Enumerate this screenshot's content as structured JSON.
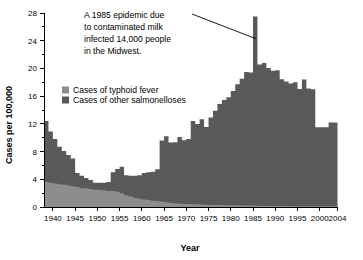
{
  "chart_data": {
    "type": "area",
    "title": "",
    "xlabel": "Year",
    "ylabel": "Cases per 100,000",
    "xlim": [
      1938,
      2004
    ],
    "ylim": [
      0,
      28
    ],
    "grid": false,
    "legend_position": "inside-upper-left",
    "y_ticks": [
      0,
      4,
      8,
      12,
      16,
      20,
      24,
      28
    ],
    "y_minor_ticks": [
      2,
      6,
      10,
      14,
      18,
      22,
      26
    ],
    "x_ticks": [
      1940,
      1945,
      1950,
      1955,
      1960,
      1965,
      1970,
      1975,
      1980,
      1985,
      1990,
      1995,
      2000,
      2004
    ],
    "x_tick_labels": [
      "1940",
      "1945",
      "1950",
      "1955",
      "1960",
      "1965",
      "1970",
      "1975",
      "1980",
      "1985",
      "1990",
      "1995",
      "2000",
      "2004"
    ],
    "colors": {
      "typhoid": "#8d8d8d",
      "salmonelloses": "#595959",
      "axis": "#000000",
      "background": "#ffffff"
    },
    "x": [
      1938,
      1939,
      1940,
      1941,
      1942,
      1943,
      1944,
      1945,
      1946,
      1947,
      1948,
      1949,
      1950,
      1951,
      1952,
      1953,
      1954,
      1955,
      1956,
      1957,
      1958,
      1959,
      1960,
      1961,
      1962,
      1963,
      1964,
      1965,
      1966,
      1967,
      1968,
      1969,
      1970,
      1971,
      1972,
      1973,
      1974,
      1975,
      1976,
      1977,
      1978,
      1979,
      1980,
      1981,
      1982,
      1983,
      1984,
      1985,
      1986,
      1987,
      1988,
      1989,
      1990,
      1991,
      1992,
      1993,
      1994,
      1995,
      1996,
      1997,
      1998,
      1999,
      2000,
      2001,
      2002,
      2003
    ],
    "series": [
      {
        "name": "Cases of typhoid fever",
        "color": "#8d8d8d",
        "values": [
          3.6,
          3.5,
          3.4,
          3.3,
          3.2,
          3.1,
          3.0,
          2.9,
          2.7,
          2.7,
          2.6,
          2.5,
          2.5,
          2.4,
          2.3,
          2.3,
          2.2,
          2.0,
          1.7,
          1.5,
          1.3,
          1.2,
          1.1,
          1.0,
          0.9,
          0.85,
          0.8,
          0.7,
          0.6,
          0.55,
          0.5,
          0.45,
          0.42,
          0.4,
          0.38,
          0.35,
          0.33,
          0.3,
          0.3,
          0.28,
          0.26,
          0.25,
          0.24,
          0.23,
          0.22,
          0.2,
          0.2,
          0.19,
          0.18,
          0.17,
          0.16,
          0.15,
          0.15,
          0.14,
          0.13,
          0.13,
          0.12,
          0.12,
          0.11,
          0.11,
          0.1,
          0.1,
          0.1,
          0.1,
          0.1,
          0.1
        ]
      },
      {
        "name": "Cases of other salmonelloses",
        "color": "#595959",
        "values": [
          8.8,
          7.4,
          6.4,
          5.4,
          4.9,
          4.4,
          4.0,
          2.0,
          1.8,
          1.5,
          1.3,
          1.0,
          1.0,
          1.1,
          1.3,
          2.7,
          3.3,
          3.8,
          2.9,
          3.0,
          3.2,
          3.4,
          3.8,
          4.0,
          4.2,
          4.6,
          8.8,
          9.5,
          8.7,
          8.8,
          9.6,
          9.2,
          9.4,
          12.0,
          11.6,
          12.3,
          11.2,
          12.6,
          13.6,
          14.6,
          15.2,
          15.6,
          16.5,
          17.5,
          18.3,
          19.3,
          19.2,
          27.3,
          20.4,
          20.6,
          19.9,
          19.5,
          19.6,
          18.3,
          18.0,
          17.7,
          17.9,
          16.9,
          18.3,
          17.0,
          16.9,
          11.4,
          11.4,
          11.4,
          12.1,
          12.1
        ]
      }
    ],
    "annotation": {
      "lines": [
        "A 1985 epidemic due",
        "to contaminated milk",
        "infected 14,000 people",
        "in the Midwest."
      ],
      "target_year": 1985,
      "target_value": 24.3
    }
  }
}
